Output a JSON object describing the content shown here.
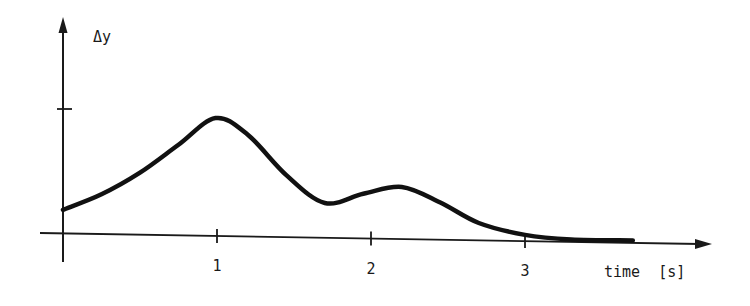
{
  "chart_data": {
    "type": "line",
    "title": "",
    "xlabel": "time  [s]",
    "ylabel": "Δy",
    "x_ticks": [
      {
        "value": 1,
        "label": "1"
      },
      {
        "value": 2,
        "label": "2"
      },
      {
        "value": 3,
        "label": "3"
      }
    ],
    "y_ticks": [
      {
        "value": 1,
        "label": ""
      }
    ],
    "xlim": [
      0,
      4.2
    ],
    "ylim": [
      0,
      1.7
    ],
    "grid": false,
    "legend": null,
    "series": [
      {
        "name": "Δy",
        "x": [
          0,
          0.25,
          0.5,
          0.75,
          0.99,
          1.2,
          1.45,
          1.7,
          1.95,
          2.2,
          2.45,
          2.7,
          3.0,
          3.3,
          3.7
        ],
        "y": [
          0.19,
          0.32,
          0.5,
          0.73,
          0.95,
          0.82,
          0.5,
          0.28,
          0.36,
          0.42,
          0.3,
          0.14,
          0.05,
          0.02,
          0.02
        ]
      }
    ]
  }
}
